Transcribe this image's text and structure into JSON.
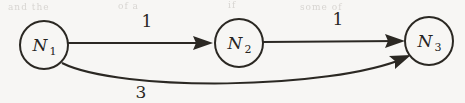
{
  "figure": {
    "kind": "directed-weighted-graph",
    "background_color": "#f7f6f4",
    "ink_color": "#2b2823",
    "artifacts": [
      {
        "text": "and the",
        "x": 8,
        "y": 2
      },
      {
        "text": "of a",
        "x": 118,
        "y": 1
      },
      {
        "text": "if",
        "x": 228,
        "y": 0
      },
      {
        "text": "some of",
        "x": 300,
        "y": 2
      }
    ]
  },
  "nodes": [
    {
      "id": "n1",
      "label": "N",
      "subscript": "1",
      "cx": 44,
      "cy": 45,
      "r": 24
    },
    {
      "id": "n2",
      "label": "N",
      "subscript": "2",
      "cx": 239,
      "cy": 43,
      "r": 24
    },
    {
      "id": "n3",
      "label": "N",
      "subscript": "3",
      "cx": 429,
      "cy": 41,
      "r": 24
    }
  ],
  "edges": [
    {
      "id": "e1",
      "from": "N1",
      "to": "N2",
      "weight": "1",
      "shape": "straight",
      "path": "M 68 43 L 208 43",
      "arrow": "M 213 43 L 193 36 L 196 43 L 193 50 Z",
      "label_x": 147,
      "label_y": 27
    },
    {
      "id": "e2",
      "from": "N2",
      "to": "N3",
      "weight": "1",
      "shape": "straight",
      "path": "M 263 42 L 399 41",
      "arrow": "M 405 41 L 385 34 L 388 41 L 385 48 Z",
      "label_x": 338,
      "label_y": 25
    },
    {
      "id": "e3",
      "from": "N1",
      "to": "N3",
      "weight": "3",
      "shape": "curved",
      "path": "M 62 63 C 120 92, 330 90, 405 58",
      "arrow": "M 411 55 L 389 56 L 395 61 L 395 69 Z",
      "label_x": 141,
      "label_y": 98
    }
  ]
}
